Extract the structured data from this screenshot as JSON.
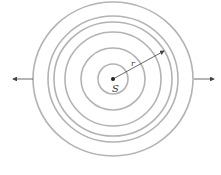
{
  "diagram": {
    "source_label": "S",
    "radius_label": "r",
    "center": {
      "x": 113,
      "y": 79
    },
    "ring_color": "#b3b3b3",
    "arrow_color": "#444444",
    "rings": [
      {
        "rx": 15,
        "ry": 15
      },
      {
        "rx": 32,
        "ry": 31
      },
      {
        "rx": 48,
        "ry": 47
      },
      {
        "rx": 59,
        "ry": 57
      },
      {
        "rx": 65,
        "ry": 63
      },
      {
        "rx": 80,
        "ry": 77
      }
    ]
  }
}
